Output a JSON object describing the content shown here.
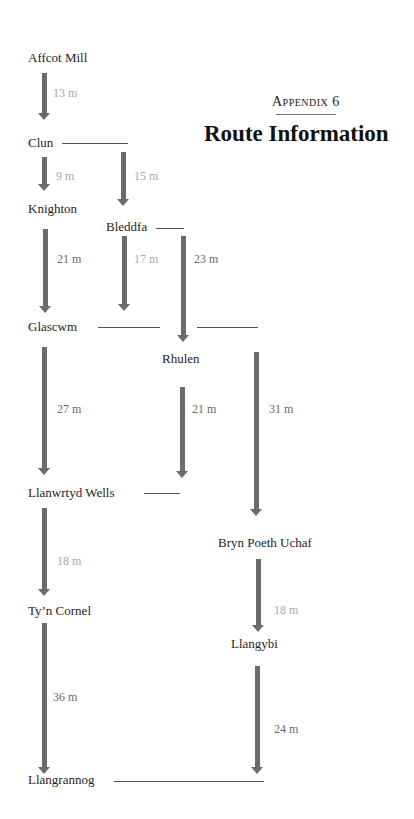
{
  "header": {
    "appendix": "Appendix 6",
    "title": "Route Information"
  },
  "places": {
    "affcot_mill": "Affcot Mill",
    "clun": "Clun",
    "knighton": "Knighton",
    "bleddfa": "Bleddfa",
    "glascwm": "Glascwm",
    "rhulen": "Rhulen",
    "llanwrtyd_wells": "Llanwrtyd Wells",
    "bryn_poeth_uchaf": "Bryn Poeth Uchaf",
    "tyn_cornel": "Ty’n Cornel",
    "llangybi": "Llangybi",
    "llangrannog": "Llangrannog"
  },
  "routes": [
    {
      "from": "Affcot Mill",
      "to": "Clun",
      "distance": "13 m"
    },
    {
      "from": "Clun",
      "to": "Knighton",
      "distance": "9 m"
    },
    {
      "from": "Clun",
      "to": "Bleddfa",
      "distance": "15 m"
    },
    {
      "from": "Knighton",
      "to": "Glascwm",
      "distance": "21 m"
    },
    {
      "from": "Bleddfa",
      "to": "Glascwm",
      "distance": "17 m"
    },
    {
      "from": "Bleddfa",
      "to": "Rhulen",
      "distance": "23 m"
    },
    {
      "from": "Glascwm",
      "to": "Llanwrtyd Wells",
      "distance": "27 m"
    },
    {
      "from": "Rhulen",
      "to": "Llanwrtyd Wells",
      "distance": "21 m"
    },
    {
      "from": "Glascwm",
      "to": "Bryn Poeth Uchaf",
      "distance": "31 m"
    },
    {
      "from": "Llanwrtyd Wells",
      "to": "Ty’n Cornel",
      "distance": "18 m"
    },
    {
      "from": "Bryn Poeth Uchaf",
      "to": "Llangybi",
      "distance": "18 m"
    },
    {
      "from": "Ty’n Cornel",
      "to": "Llangrannog",
      "distance": "36 m"
    },
    {
      "from": "Llangybi",
      "to": "Llangrannog",
      "distance": "24 m"
    }
  ],
  "colors": {
    "arrow": "#6b6b6b",
    "distance_light": "#a8a8a8",
    "distance_dark": "#6a6a6a"
  }
}
